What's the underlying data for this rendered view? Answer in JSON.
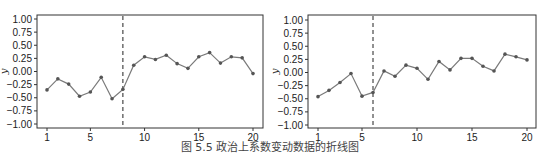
{
  "caption": "图 5.5    政治上系数变动数据的折线图",
  "chart_data": [
    {
      "type": "line",
      "title": "",
      "xlabel": "",
      "ylabel": "y",
      "xlim": [
        0.3,
        20.8
      ],
      "ylim": [
        -1.08,
        1.08
      ],
      "xticks": [
        1,
        5,
        10,
        15,
        20
      ],
      "yticks": [
        1.0,
        0.75,
        0.5,
        0.25,
        0.0,
        -0.25,
        -0.5,
        -0.75,
        -1.0
      ],
      "ytick_labels": [
        "1.00",
        "0.75",
        "0.50",
        "0.25",
        "0.00",
        "−0.25",
        "−0.50",
        "−0.75",
        "−1.00"
      ],
      "grid": false,
      "x": [
        1,
        2,
        3,
        4,
        5,
        6,
        7,
        8,
        9,
        10,
        11,
        12,
        13,
        14,
        15,
        16,
        17,
        18,
        19,
        20
      ],
      "values": [
        -0.35,
        -0.14,
        -0.24,
        -0.47,
        -0.39,
        -0.11,
        -0.52,
        -0.34,
        0.12,
        0.28,
        0.23,
        0.31,
        0.15,
        0.06,
        0.28,
        0.36,
        0.16,
        0.28,
        0.26,
        -0.04
      ],
      "vline_x": 8,
      "vline_style": "dashed"
    },
    {
      "type": "line",
      "title": "",
      "xlabel": "",
      "ylabel": "y",
      "xlim": [
        0.3,
        20.8
      ],
      "ylim": [
        -1.08,
        1.08
      ],
      "xticks": [
        1,
        5,
        10,
        15,
        20
      ],
      "yticks": [
        1.0,
        0.75,
        0.5,
        0.25,
        0.0,
        -0.25,
        -0.5,
        -0.75,
        -1.0
      ],
      "ytick_labels": [
        "1.00",
        "0.75",
        "0.50",
        "0.25",
        "0.00",
        "−0.25",
        "−0.50",
        "−0.75",
        "−1.00"
      ],
      "grid": false,
      "x": [
        1,
        2,
        3,
        4,
        5,
        6,
        7,
        8,
        9,
        10,
        11,
        12,
        13,
        14,
        15,
        16,
        17,
        18,
        19,
        20
      ],
      "values": [
        -0.46,
        -0.34,
        -0.19,
        -0.02,
        -0.45,
        -0.38,
        0.03,
        -0.07,
        0.14,
        0.08,
        -0.13,
        0.21,
        0.05,
        0.27,
        0.27,
        0.12,
        0.03,
        0.35,
        0.3,
        0.24
      ],
      "vline_x": 6,
      "vline_style": "dashed"
    }
  ],
  "colors": {
    "line": "#7a7a7a",
    "marker": "#555555",
    "frame": "#333333",
    "vline": "#222222"
  }
}
